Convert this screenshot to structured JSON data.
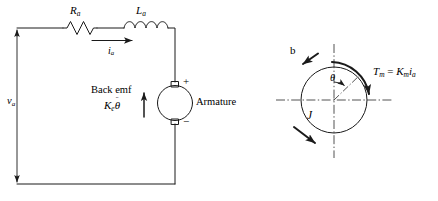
{
  "figure": {
    "stroke_color": "#1a1a1a",
    "background": "#ffffff"
  },
  "circuit": {
    "source_label": "v",
    "source_sub": "a",
    "resistor": {
      "label": "R",
      "sub": "a",
      "name": "armature-resistance"
    },
    "inductor": {
      "label": "L",
      "sub": "a",
      "name": "armature-inductance"
    },
    "current": {
      "label": "i",
      "sub": "a",
      "direction": "right"
    },
    "back_emf": {
      "line1": "Back emf",
      "symbol_main": "K",
      "symbol_sub": "e",
      "theta": "θ",
      "dots": "¨"
    },
    "motor": {
      "label": "Armature",
      "plus": "+",
      "minus": "−"
    }
  },
  "rotational": {
    "damping_label": "b",
    "inertia_label": "J",
    "angle_label": "θ",
    "torque_equation": {
      "t_main": "T",
      "t_sub": "m",
      "equals": "=",
      "k_main": "K",
      "k_sub": "m",
      "i_main": "i",
      "i_sub": "a"
    }
  }
}
